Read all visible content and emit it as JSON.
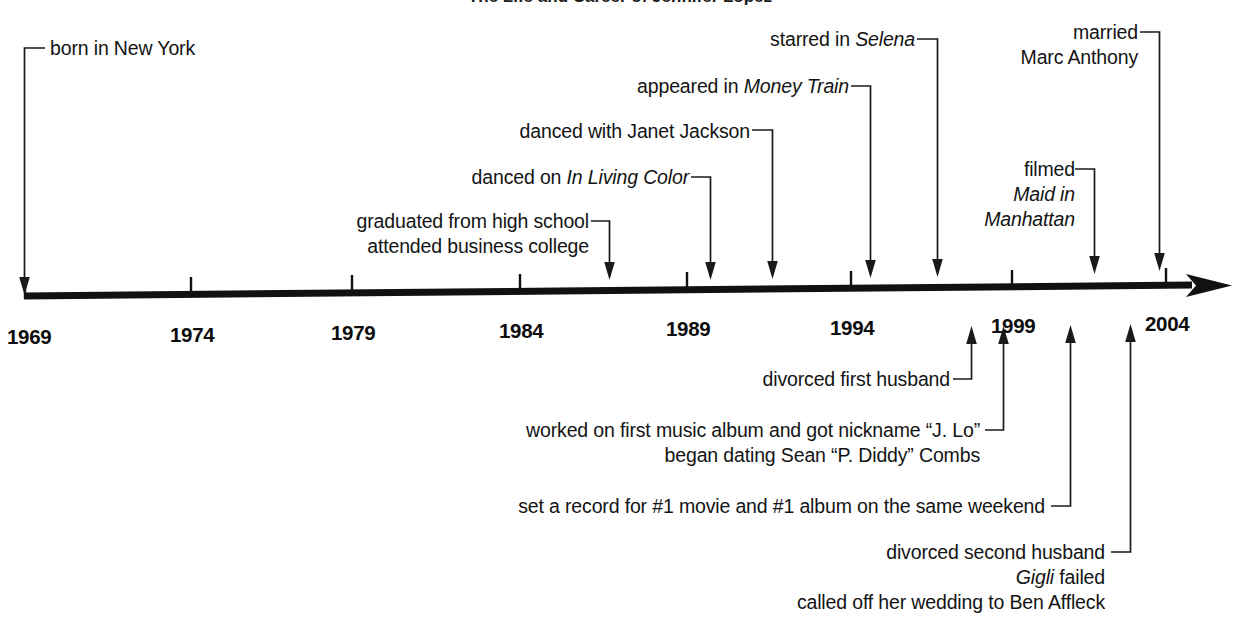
{
  "figure": {
    "title": "The Life and Career of Jennifer Lopez",
    "title_clipped": true,
    "background_color": "#ffffff",
    "ink_color": "#141414"
  },
  "axis": {
    "orientation": "horizontal",
    "arrowhead": "right",
    "year_labels": [
      "1969",
      "1974",
      "1979",
      "1984",
      "1989",
      "1994",
      "1999",
      "2004"
    ],
    "tick_years": [
      1969,
      1974,
      1979,
      1984,
      1989,
      1994,
      1999,
      2004
    ],
    "range_start": 1969,
    "range_end": 2004
  },
  "events_above": [
    {
      "id": "born",
      "lines": [
        {
          "text": "born in New York",
          "italic_part": ""
        }
      ],
      "year": 1969
    },
    {
      "id": "graduated",
      "lines": [
        {
          "text": "graduated from high school",
          "italic_part": ""
        },
        {
          "text": "attended business college",
          "italic_part": ""
        }
      ],
      "year": 1987
    },
    {
      "id": "in-living-color",
      "lines": [
        {
          "prefix": "danced on ",
          "italic": "In Living Color",
          "suffix": ""
        }
      ],
      "year": 1990
    },
    {
      "id": "janet-jackson",
      "lines": [
        {
          "text": "danced with Janet Jackson",
          "italic_part": ""
        }
      ],
      "year": 1992
    },
    {
      "id": "money-train",
      "lines": [
        {
          "prefix": "appeared in ",
          "italic": "Money Train",
          "suffix": ""
        }
      ],
      "year": 1995
    },
    {
      "id": "selena",
      "lines": [
        {
          "prefix": "starred in ",
          "italic": "Selena",
          "suffix": ""
        }
      ],
      "year": 1997
    },
    {
      "id": "maid-in-manhattan",
      "lines": [
        {
          "text": "filmed",
          "italic_part": ""
        },
        {
          "prefix": "",
          "italic": "Maid in",
          "suffix": ""
        },
        {
          "prefix": "",
          "italic": "Manhattan",
          "suffix": ""
        }
      ],
      "year": 2002
    },
    {
      "id": "married-marc-anthony",
      "lines": [
        {
          "text": "married",
          "italic_part": ""
        },
        {
          "text": "Marc Anthony",
          "italic_part": ""
        }
      ],
      "year": 2004
    }
  ],
  "events_below": [
    {
      "id": "divorced-first-husband",
      "lines": [
        {
          "text": "divorced first husband",
          "italic_part": ""
        }
      ],
      "year": 1998
    },
    {
      "id": "jlo-nickname",
      "lines": [
        {
          "text": "worked on first music album and got nickname “J. Lo”",
          "italic_part": ""
        },
        {
          "text": "began dating Sean “P. Diddy” Combs",
          "italic_part": ""
        }
      ],
      "year": 1999
    },
    {
      "id": "record-movie-album",
      "lines": [
        {
          "text": "set a record for #1 movie and #1 album on the same weekend",
          "italic_part": ""
        }
      ],
      "year": 2001
    },
    {
      "id": "divorced-second-husband",
      "lines": [
        {
          "text": "divorced second husband",
          "italic_part": ""
        },
        {
          "prefix": "",
          "italic": "Gigli",
          "suffix": " failed"
        },
        {
          "text": "called off her wedding to Ben Affleck",
          "italic_part": ""
        }
      ],
      "year": 2003
    }
  ],
  "labels": {
    "born": "born in New York",
    "graduated_1": "graduated from high school",
    "graduated_2": "attended business college",
    "ilc_prefix": "danced on ",
    "ilc_italic": "In Living Color",
    "janet": "danced with Janet Jackson",
    "money_prefix": "appeared in ",
    "money_italic": "Money Train",
    "selena_prefix": "starred in ",
    "selena_italic": "Selena",
    "filmed": "filmed",
    "maid_1": "Maid in",
    "maid_2": "Manhattan",
    "married": "married",
    "marc_anthony": "Marc Anthony",
    "divorced_first": "divorced first husband",
    "jlo_1": "worked on first music album and got nickname “J. Lo”",
    "jlo_2": "began dating Sean “P. Diddy” Combs",
    "record": "set a record for #1 movie and #1 album on the same weekend",
    "divorced_second": "divorced second husband",
    "gigli_italic": "Gigli",
    "gigli_suffix": " failed",
    "ben_affleck": "called off her wedding to Ben Affleck"
  },
  "years": {
    "y1969": "1969",
    "y1974": "1974",
    "y1979": "1979",
    "y1984": "1984",
    "y1989": "1989",
    "y1994": "1994",
    "y1999": "1999",
    "y2004": "2004"
  }
}
